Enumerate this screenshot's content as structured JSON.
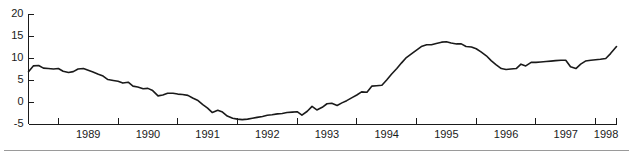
{
  "chart_data": {
    "type": "line",
    "title": "",
    "subtitle": "",
    "xlabel": "",
    "ylabel": "",
    "ylim": [
      -5,
      20
    ],
    "yticks": [
      -5,
      0,
      5,
      10,
      15,
      20
    ],
    "ytick_labels": [
      "-5",
      "0",
      "5",
      "10",
      "15",
      "20"
    ],
    "xlim": [
      1988.5,
      1998.35
    ],
    "xticks": [
      1989,
      1990,
      1991,
      1992,
      1993,
      1994,
      1995,
      1996,
      1997,
      1998
    ],
    "xtick_labels": [
      "1989",
      "1990",
      "1991",
      "1992",
      "1993",
      "1994",
      "1995",
      "1996",
      "1997",
      "1998"
    ],
    "xtick_label_placement": "between-ticks",
    "grid": false,
    "legend": null,
    "legend_position": "none",
    "line_color": "#1a1a1a",
    "series": [
      {
        "name": "series-1",
        "x": [
          1988.5,
          1988.58,
          1988.67,
          1988.75,
          1988.83,
          1988.92,
          1989.0,
          1989.08,
          1989.17,
          1989.25,
          1989.33,
          1989.42,
          1989.5,
          1989.58,
          1989.67,
          1989.75,
          1989.83,
          1989.92,
          1990.0,
          1990.08,
          1990.17,
          1990.25,
          1990.33,
          1990.42,
          1990.5,
          1990.58,
          1990.67,
          1990.75,
          1990.83,
          1990.92,
          1991.0,
          1991.08,
          1991.17,
          1991.25,
          1991.33,
          1991.42,
          1991.5,
          1991.58,
          1991.67,
          1991.75,
          1991.83,
          1991.92,
          1992.0,
          1992.08,
          1992.17,
          1992.25,
          1992.33,
          1992.42,
          1992.5,
          1992.58,
          1992.67,
          1992.75,
          1992.83,
          1992.92,
          1993.0,
          1993.08,
          1993.17,
          1993.25,
          1993.33,
          1993.42,
          1993.5,
          1993.58,
          1993.67,
          1993.75,
          1993.83,
          1993.92,
          1994.0,
          1994.08,
          1994.17,
          1994.25,
          1994.33,
          1994.42,
          1994.5,
          1994.58,
          1994.67,
          1994.75,
          1994.83,
          1994.92,
          1995.0,
          1995.08,
          1995.17,
          1995.25,
          1995.33,
          1995.42,
          1995.5,
          1995.58,
          1995.67,
          1995.75,
          1995.83,
          1995.92,
          1996.0,
          1996.08,
          1996.17,
          1996.25,
          1996.33,
          1996.42,
          1996.5,
          1996.58,
          1996.67,
          1996.75,
          1996.83,
          1996.92,
          1997.0,
          1997.08,
          1997.17,
          1997.25,
          1997.33,
          1997.42,
          1997.5,
          1997.58,
          1997.67,
          1997.75,
          1997.83,
          1997.92,
          1998.0,
          1998.08,
          1998.17,
          1998.25,
          1998.35
        ],
        "values": [
          6.9,
          8.2,
          8.3,
          7.7,
          7.6,
          7.5,
          7.6,
          7.0,
          6.7,
          6.9,
          7.5,
          7.6,
          7.2,
          6.8,
          6.3,
          5.9,
          5.1,
          4.9,
          4.7,
          4.3,
          4.5,
          3.6,
          3.4,
          3.0,
          3.1,
          2.6,
          1.4,
          1.6,
          2.0,
          2.0,
          1.8,
          1.7,
          1.5,
          0.9,
          0.4,
          -0.6,
          -1.4,
          -2.4,
          -1.9,
          -2.3,
          -3.2,
          -3.7,
          -3.9,
          -4.0,
          -3.9,
          -3.7,
          -3.5,
          -3.3,
          -3.0,
          -2.9,
          -2.7,
          -2.6,
          -2.4,
          -2.3,
          -2.2,
          -3.0,
          -2.1,
          -1.0,
          -1.8,
          -1.2,
          -0.4,
          -0.3,
          -0.8,
          -0.2,
          0.3,
          1.0,
          1.6,
          2.3,
          2.2,
          3.6,
          3.7,
          3.8,
          5.0,
          6.3,
          7.6,
          8.9,
          10.1,
          11.0,
          11.8,
          12.6,
          13.0,
          13.0,
          13.3,
          13.6,
          13.7,
          13.4,
          13.2,
          13.2,
          12.6,
          12.5,
          12.1,
          11.4,
          10.5,
          9.4,
          8.5,
          7.6,
          7.4,
          7.5,
          7.6,
          8.6,
          8.2,
          9.0,
          9.0,
          9.1,
          9.2,
          9.3,
          9.4,
          9.5,
          9.5,
          8.0,
          7.6,
          8.6,
          9.3,
          9.5,
          9.6,
          9.7,
          9.9,
          11.0,
          12.6
        ]
      }
    ]
  }
}
